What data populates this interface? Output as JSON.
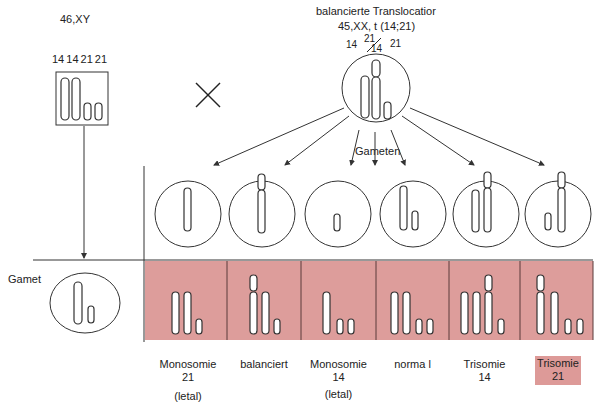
{
  "father": {
    "karyotype": "46,XY",
    "chromosome_labels": "14  14 21 21"
  },
  "cross_symbol": "×",
  "mother": {
    "title": "balancierte Translocatior",
    "karyotype": "45,XX, t (14;21)",
    "label_14": "14",
    "label_21_over_14": "21",
    "label_14_sub": "14",
    "label_21": "21"
  },
  "gameten_label": "Gameten",
  "gamet_label": "Gamet",
  "results": [
    {
      "line1": "Monosomie",
      "line2": "21",
      "note": "(letal)",
      "highlight": false
    },
    {
      "line1": "balanciert",
      "line2": "",
      "note": "",
      "highlight": false
    },
    {
      "line1": "Monosomie",
      "line2": "14",
      "note": "(letal)",
      "highlight": false
    },
    {
      "line1": "norma l",
      "line2": "",
      "note": "",
      "highlight": false
    },
    {
      "line1": "Trisomie",
      "line2": "14",
      "note": "",
      "highlight": false
    },
    {
      "line1": "Trisomie",
      "line2": "21",
      "note": "",
      "highlight": true
    }
  ],
  "colors": {
    "zygote_fill": "#dd9d9b",
    "highlight": "#dd9a98",
    "line": "#333333"
  }
}
